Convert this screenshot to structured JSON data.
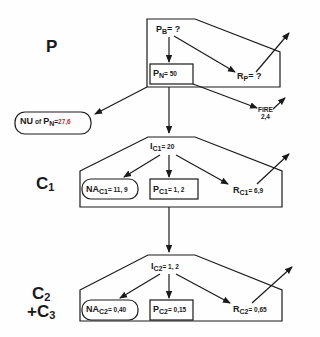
{
  "levels": {
    "p": {
      "label": "P"
    },
    "c1": {
      "label": "C",
      "sub": "1"
    },
    "c2c3": {
      "line1": "C",
      "line1_sub": "2",
      "line2": "+C",
      "line2_sub": "3"
    }
  },
  "p_box": {
    "pb": {
      "main": "P",
      "sub": "B",
      "value": "= ?"
    },
    "pn": {
      "main": "P",
      "sub": "N",
      "value": "= 50"
    },
    "rp": {
      "main": "R",
      "sub": "P",
      "value": "= ?"
    }
  },
  "nu": {
    "main": "NU",
    "of": "of",
    "p": "P",
    "sub": "N",
    "eq": "=",
    "value": "27,6"
  },
  "fire": {
    "label": "FIRE",
    "value": "2,4"
  },
  "c1_box": {
    "ic": {
      "main": "I",
      "sub": "C1",
      "value": "= 20"
    },
    "na": {
      "main": "NA",
      "sub": "C1",
      "value": "= 11, 9"
    },
    "p": {
      "main": "P",
      "sub": "C1",
      "value": "= 1, 2"
    },
    "r": {
      "main": "R",
      "sub": "C1",
      "value": "= 6,9"
    }
  },
  "c2_box": {
    "ic": {
      "main": "I",
      "sub": "C2",
      "value": "= 1, 2"
    },
    "na": {
      "main": "NA",
      "sub": "C2",
      "value": "= 0,40"
    },
    "p": {
      "main": "P",
      "sub": "C2",
      "value": "= 0,15"
    },
    "r": {
      "main": "R",
      "sub": "C2",
      "value": "= 0,65"
    }
  },
  "colors": {
    "line": "#1a1a1a",
    "highlight": "#c0282e"
  }
}
